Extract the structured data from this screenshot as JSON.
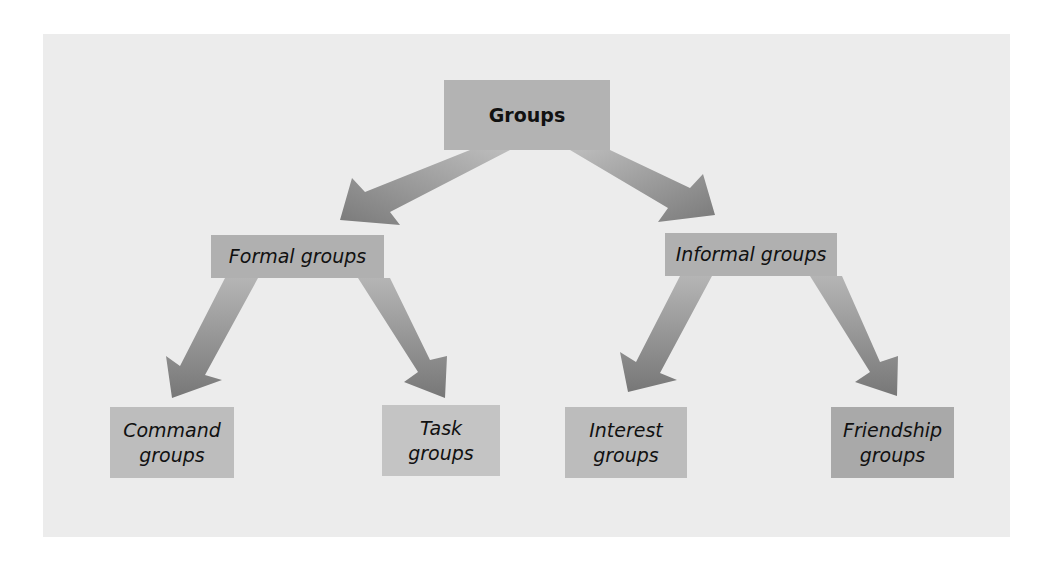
{
  "diagram": {
    "type": "hierarchy",
    "root": {
      "label": "Groups"
    },
    "level1": [
      {
        "label": "Formal groups"
      },
      {
        "label": "Informal groups"
      }
    ],
    "level2": [
      {
        "label_line1": "Command",
        "label_line2": "groups",
        "parent": "Formal groups"
      },
      {
        "label_line1": "Task",
        "label_line2": "groups",
        "parent": "Formal groups"
      },
      {
        "label_line1": "Interest",
        "label_line2": "groups",
        "parent": "Informal groups"
      },
      {
        "label_line1": "Friendship",
        "label_line2": "groups",
        "parent": "Informal groups"
      }
    ],
    "colors": {
      "background": "#ececec",
      "box": "#b3b3b3",
      "arrow_light": "#bdbdbd",
      "arrow_dark": "#7a7a7a",
      "text": "#111111"
    }
  }
}
